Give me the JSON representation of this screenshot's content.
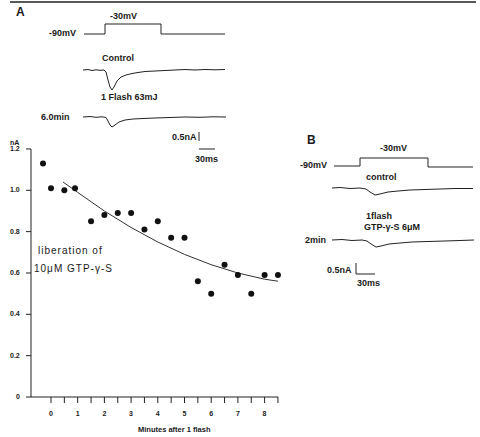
{
  "panel_a": {
    "letter": "A",
    "voltage_low": "-90mV",
    "voltage_high": "-30mV",
    "trace_control_label": "Control",
    "flash_label": "1 Flash 63mJ",
    "trace_later_label": "6.0min",
    "scale_current": "0.5nA",
    "scale_time": "30ms"
  },
  "panel_b": {
    "letter": "B",
    "voltage_low": "-90mV",
    "voltage_high": "-30mV",
    "trace_control_label": "control",
    "flash_label": "1flash",
    "drug_label": "GTP-γ-S  6μM",
    "trace_later_label": "2min",
    "scale_current": "0.5nA",
    "scale_time": "30ms"
  },
  "chart_data": {
    "type": "scatter",
    "title": "",
    "xlabel": "Minutes after 1 flash",
    "ylabel": "nA",
    "xlim": [
      -0.5,
      8.5
    ],
    "ylim": [
      0,
      1.2
    ],
    "x_ticks": [
      "0",
      "1",
      "2",
      "3",
      "4",
      "5",
      "6",
      "7",
      "8"
    ],
    "y_ticks": [
      "0",
      "0.2",
      "0.4",
      "0.6",
      "0.8",
      "1.0",
      "1.2"
    ],
    "grid": false,
    "annotation": [
      "liberation of",
      "10μM GTP-γ-S"
    ],
    "series": [
      {
        "name": "peak current",
        "x": [
          -0.3,
          0,
          0.5,
          0.9,
          1.5,
          2,
          2.5,
          3,
          3.5,
          4,
          4.5,
          5,
          5.5,
          6,
          6.5,
          7,
          7.5,
          8,
          8.5
        ],
        "values": [
          1.13,
          1.01,
          1.0,
          1.01,
          0.85,
          0.88,
          0.89,
          0.89,
          0.81,
          0.85,
          0.77,
          0.77,
          0.56,
          0.5,
          0.64,
          0.59,
          0.5,
          0.59,
          0.59
        ]
      },
      {
        "name": "fit curve",
        "x": [
          0.45,
          1,
          2,
          3,
          4,
          5,
          6,
          7,
          8,
          8.5
        ],
        "values": [
          1.04,
          0.99,
          0.9,
          0.82,
          0.75,
          0.69,
          0.64,
          0.6,
          0.57,
          0.56
        ]
      }
    ]
  }
}
